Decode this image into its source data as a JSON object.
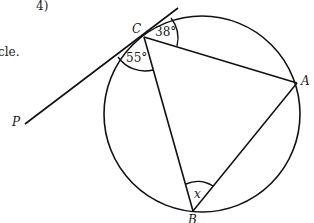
{
  "question": {
    "number_label": "4)",
    "partial_text": "cle."
  },
  "diagram": {
    "type": "circle-theorem",
    "circle": {
      "cx": 202,
      "cy": 114,
      "r": 98
    },
    "points": {
      "C": {
        "label": "C",
        "x": 144,
        "y": 37
      },
      "A": {
        "label": "A",
        "x": 297,
        "y": 83
      },
      "B": {
        "label": "B",
        "x": 193,
        "y": 211
      },
      "P": {
        "label": "P",
        "x": 25,
        "y": 124
      }
    },
    "tangent": {
      "from": "P",
      "through": "C",
      "end_x": 178,
      "end_y": 8
    },
    "angles": [
      {
        "id": "angle-tangent-CA",
        "label": "38°",
        "vertex": "C"
      },
      {
        "id": "angle-tangent-CB",
        "label": "55°",
        "vertex": "C"
      },
      {
        "id": "angle-x",
        "label": "x",
        "vertex": "B"
      }
    ],
    "stroke_color": "#111111"
  }
}
